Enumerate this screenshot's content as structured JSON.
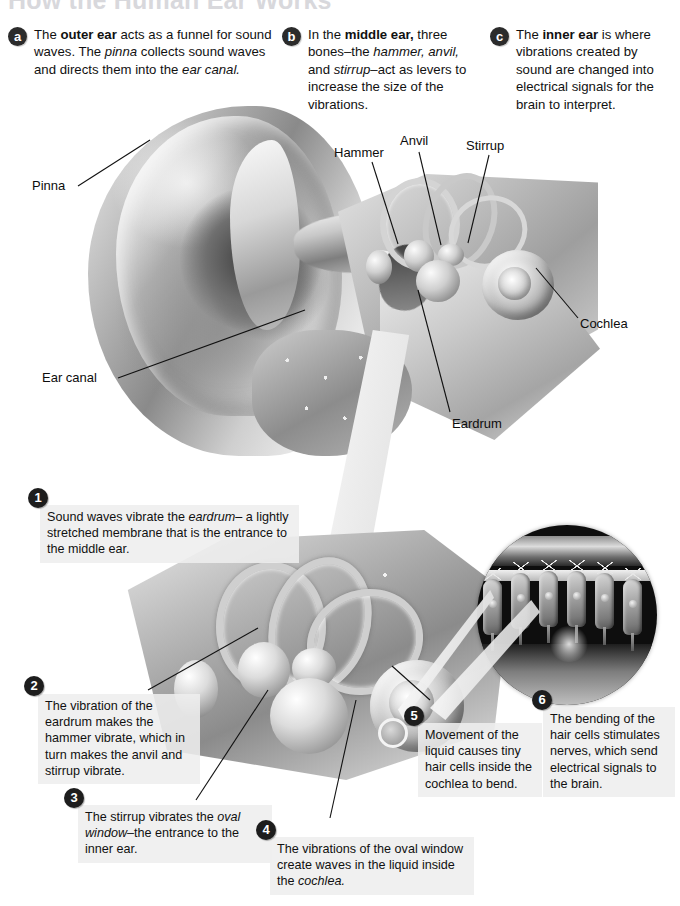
{
  "page": {
    "title": "How the Human Ear Works"
  },
  "intro": [
    {
      "badge": "a",
      "segments": [
        {
          "t": "The ",
          "s": "plain"
        },
        {
          "t": "outer ear",
          "s": "bold"
        },
        {
          "t": " acts as a funnel for sound waves. The ",
          "s": "plain"
        },
        {
          "t": "pinna",
          "s": "italic"
        },
        {
          "t": " collects sound waves and directs them into the ",
          "s": "plain"
        },
        {
          "t": "ear canal.",
          "s": "italic"
        }
      ]
    },
    {
      "badge": "b",
      "segments": [
        {
          "t": "In the ",
          "s": "plain"
        },
        {
          "t": "middle ear,",
          "s": "bold"
        },
        {
          "t": " three bones–the ",
          "s": "plain"
        },
        {
          "t": "hammer, anvil,",
          "s": "italic"
        },
        {
          "t": " and ",
          "s": "plain"
        },
        {
          "t": "stirrup",
          "s": "italic"
        },
        {
          "t": "–act as levers to increase the size of the vibrations.",
          "s": "plain"
        }
      ]
    },
    {
      "badge": "c",
      "segments": [
        {
          "t": "The ",
          "s": "plain"
        },
        {
          "t": "inner ear",
          "s": "bold"
        },
        {
          "t": " is where vibrations created by sound are changed into electrical signals for the brain to interpret.",
          "s": "plain"
        }
      ]
    }
  ],
  "anatomy_labels": [
    {
      "name": "pinna",
      "text": "Pinna"
    },
    {
      "name": "ear-canal",
      "text": "Ear canal"
    },
    {
      "name": "hammer",
      "text": "Hammer"
    },
    {
      "name": "anvil",
      "text": "Anvil"
    },
    {
      "name": "stirrup",
      "text": "Stirrup"
    },
    {
      "name": "cochlea",
      "text": "Cochlea"
    },
    {
      "name": "eardrum",
      "text": "Eardrum"
    }
  ],
  "steps": [
    {
      "number": "1",
      "segments": [
        {
          "t": "Sound waves vibrate the ",
          "s": "plain"
        },
        {
          "t": "eardrum–",
          "s": "italic"
        },
        {
          "t": "\na lightly stretched membrane that is the entrance to the middle ear.",
          "s": "plain"
        }
      ]
    },
    {
      "number": "2",
      "segments": [
        {
          "t": "The vibration of the eardrum makes the hammer vibrate, which in turn makes the anvil and stirrup vibrate.",
          "s": "plain"
        }
      ]
    },
    {
      "number": "3",
      "segments": [
        {
          "t": "The stirrup vibrates the ",
          "s": "plain"
        },
        {
          "t": "oval window",
          "s": "italic"
        },
        {
          "t": "–the entrance to the inner ear.",
          "s": "plain"
        }
      ]
    },
    {
      "number": "4",
      "segments": [
        {
          "t": "The vibrations of the oval window create waves in the liquid inside the ",
          "s": "plain"
        },
        {
          "t": "cochlea.",
          "s": "italic"
        }
      ]
    },
    {
      "number": "5",
      "segments": [
        {
          "t": "Movement of the liquid causes tiny hair cells inside the cochlea to bend.",
          "s": "plain"
        }
      ]
    },
    {
      "number": "6",
      "segments": [
        {
          "t": "The bending of the hair cells stimulates nerves, which send electrical signals to the brain.",
          "s": "plain"
        }
      ]
    }
  ],
  "colors": {
    "badge_dark": "#1d1d1d",
    "box_background": "#eeeeee",
    "text": "#111111",
    "title_faded": "#d8d8dc",
    "inset_background": "#0e0e0e"
  }
}
